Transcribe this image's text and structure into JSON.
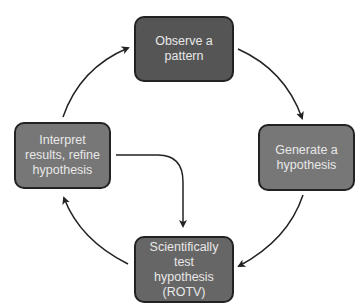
{
  "diagram": {
    "type": "cycle",
    "nodes": [
      {
        "id": "observe",
        "label": "Observe a pattern",
        "lines": [
          "Observe a",
          "pattern"
        ],
        "color": "#555555"
      },
      {
        "id": "generate",
        "label": "Generate a hypothesis",
        "lines": [
          "Generate a",
          "hypothesis"
        ],
        "color": "#777777"
      },
      {
        "id": "test",
        "label": "Scientifically test hypothesis (ROTV)",
        "lines": [
          "Scientifically test",
          "hypothesis",
          "(ROTV)"
        ],
        "color": "#666666"
      },
      {
        "id": "interpret",
        "label": "Interpret results, refine hypothesis",
        "lines": [
          "Interpret",
          "results, refine",
          "hypothesis"
        ],
        "color": "#777777"
      }
    ],
    "edges": [
      {
        "from": "observe",
        "to": "generate"
      },
      {
        "from": "generate",
        "to": "test"
      },
      {
        "from": "test",
        "to": "interpret"
      },
      {
        "from": "interpret",
        "to": "observe"
      },
      {
        "from": "interpret",
        "to": "test"
      }
    ],
    "arrow_color": "#222222"
  }
}
